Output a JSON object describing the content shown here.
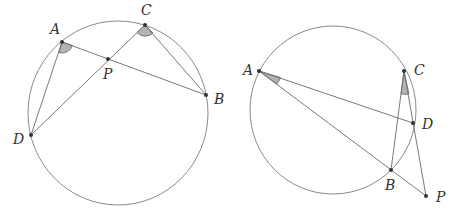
{
  "figures": [
    {
      "name": "left-figure",
      "circle": {
        "cx": 118,
        "cy": 113,
        "r": 90
      },
      "points": {
        "A": {
          "x": 62,
          "y": 42,
          "label": "A",
          "lx": 50,
          "ly": 34
        },
        "C": {
          "x": 145,
          "y": 25,
          "label": "C",
          "lx": 141,
          "ly": 15
        },
        "P": {
          "x": 108,
          "y": 59,
          "label": "P",
          "lx": 103,
          "ly": 79
        },
        "B": {
          "x": 206,
          "y": 95,
          "label": "B",
          "lx": 214,
          "ly": 104
        },
        "D": {
          "x": 31,
          "y": 135,
          "label": "D",
          "lx": 13,
          "ly": 144
        }
      },
      "segments": [
        [
          "A",
          "B"
        ],
        [
          "C",
          "D"
        ],
        [
          "A",
          "D"
        ],
        [
          "C",
          "B"
        ]
      ],
      "marked_angles": [
        "DAB",
        "DCB"
      ]
    },
    {
      "name": "right-figure",
      "circle": {
        "cx": 333,
        "cy": 110,
        "r": 83
      },
      "points": {
        "A": {
          "x": 259,
          "y": 71,
          "label": "A",
          "lx": 243,
          "ly": 75
        },
        "C": {
          "x": 404,
          "y": 71,
          "label": "C",
          "lx": 414,
          "ly": 75
        },
        "D": {
          "x": 413,
          "y": 123,
          "label": "D",
          "lx": 422,
          "ly": 129
        },
        "B": {
          "x": 391,
          "y": 170,
          "label": "B",
          "lx": 385,
          "ly": 190
        },
        "P": {
          "x": 426,
          "y": 196,
          "label": "P",
          "lx": 436,
          "ly": 202
        }
      },
      "segments": [
        [
          "A",
          "D"
        ],
        [
          "A",
          "P"
        ],
        [
          "C",
          "B"
        ],
        [
          "C",
          "P"
        ]
      ],
      "marked_angles": [
        "BAD",
        "BCD"
      ]
    }
  ]
}
